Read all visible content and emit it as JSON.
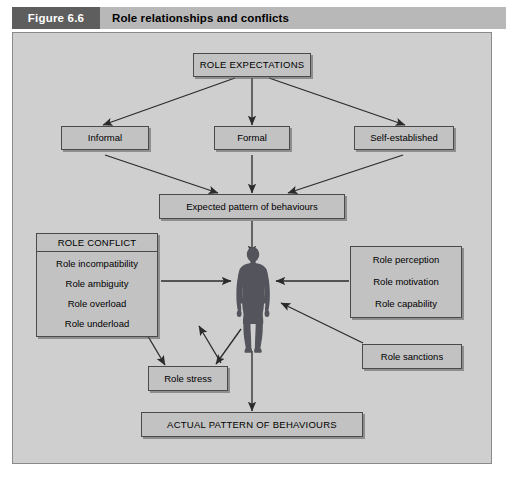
{
  "header": {
    "figure_tag": "Figure 6.6",
    "title": "Role relationships and conflicts"
  },
  "diagram": {
    "nodes": {
      "role_expectations": "ROLE EXPECTATIONS",
      "informal": "Informal",
      "formal": "Formal",
      "self_established": "Self-established",
      "expected_pattern": "Expected pattern of behaviours",
      "role_stress": "Role stress",
      "role_sanctions": "Role sanctions",
      "actual_pattern": "ACTUAL PATTERN OF BEHAVIOURS"
    },
    "role_conflict": {
      "heading": "ROLE CONFLICT",
      "items": [
        "Role incompatibility",
        "Role ambiguity",
        "Role overload",
        "Role underload"
      ]
    },
    "role_attributes": {
      "items": [
        "Role perception",
        "Role motivation",
        "Role capability"
      ]
    },
    "person_label": "person-silhouette"
  },
  "colors": {
    "panel_background": "#cfcfcf",
    "box_fill": "#c2c2c2",
    "box_border": "#4a4a4a",
    "header_bar": "#b8b8b8",
    "figure_tag_bg": "#5e5e5e",
    "arrow": "#2b2b2b",
    "figure_silhouette": "#54545c"
  }
}
